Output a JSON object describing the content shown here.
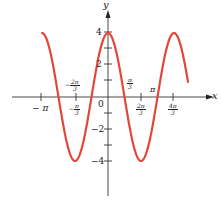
{
  "chart_data": {
    "type": "line",
    "title": "",
    "xlabel": "x",
    "ylabel": "y",
    "function": "y = 4 cos(kx)",
    "series": [
      {
        "name": "curve",
        "color": "#e2473a",
        "x_range_px": [
          42,
          188
        ],
        "amplitude": 4
      }
    ],
    "x_ticks": [
      "-π",
      "-2π/3",
      "-π/3",
      "0",
      "π/3",
      "2π/3",
      "π",
      "4π/3"
    ],
    "y_ticks": [
      "4",
      "2",
      "0",
      "-2",
      "-4"
    ],
    "ylim": [
      -5.5,
      5
    ],
    "grid": false,
    "legend": "none"
  },
  "axes": {
    "x_label": "x",
    "y_label": "y",
    "origin_label": "0",
    "y_tick_labels": {
      "p4": "4",
      "p2": "2",
      "m2": "−2",
      "m4": "−4"
    },
    "x_tick_labels": {
      "neg_pi": "− π",
      "neg_2pi3_num": "2π",
      "neg_2pi3_den": "3",
      "neg_pi3_num": "π",
      "neg_pi3_den": "3",
      "pi3_num": "π",
      "pi3_den": "3",
      "two_pi3_num": "2π",
      "two_pi3_den": "3",
      "pi": "π",
      "four_pi3_num": "4π",
      "four_pi3_den": "3"
    }
  },
  "colors": {
    "curve": "#e2473a",
    "axis": "#333333"
  }
}
